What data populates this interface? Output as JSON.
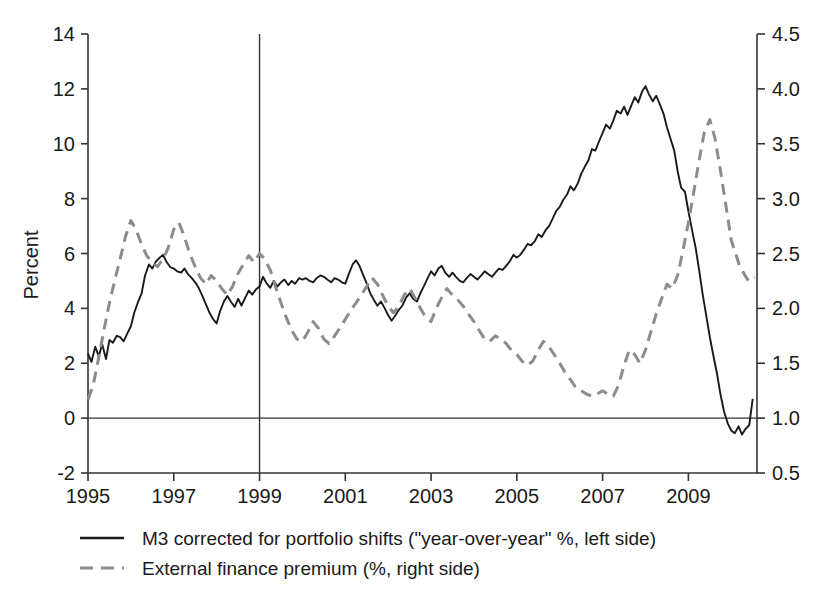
{
  "chart_data": {
    "type": "line",
    "title": "",
    "xlabel": "",
    "ylabel": "Percent",
    "y2label": "",
    "xlim": [
      1995.0,
      2010.6
    ],
    "ylim": [
      -2,
      14
    ],
    "y2lim": [
      0.5,
      4.5
    ],
    "xticks": [
      1995,
      1997,
      1999,
      2001,
      2003,
      2005,
      2007,
      2009
    ],
    "xtick_labels": [
      "1995",
      "1997",
      "1999",
      "2001",
      "2003",
      "2005",
      "2007",
      "2009"
    ],
    "yticks": [
      -2,
      0,
      2,
      4,
      6,
      8,
      10,
      12,
      14
    ],
    "ytick_labels": [
      "-2",
      "0",
      "2",
      "4",
      "6",
      "8",
      "10",
      "12",
      "14"
    ],
    "y2ticks": [
      0.5,
      1.0,
      1.5,
      2.0,
      2.5,
      3.0,
      3.5,
      4.0,
      4.5
    ],
    "y2tick_labels": [
      "0.5",
      "1.0",
      "1.5",
      "2.0",
      "2.5",
      "3.0",
      "3.5",
      "4.0",
      "4.5"
    ],
    "grid": false,
    "zero_line": 0,
    "vertical_marker": 1999,
    "legend_position": "below-left",
    "colors": {
      "m3_line": "#1a1a1a",
      "premium_line": "#8c8c8c",
      "axis": "#333333",
      "background": "#ffffff"
    },
    "series": [
      {
        "name": "M3 corrected for portfolio shifts (\"year-over-year\" %, left side)",
        "axis": "left",
        "style": "solid",
        "color": "#1a1a1a",
        "x": [
          1995.0,
          1995.08,
          1995.17,
          1995.25,
          1995.33,
          1995.42,
          1995.5,
          1995.58,
          1995.67,
          1995.75,
          1995.83,
          1995.92,
          1996.0,
          1996.08,
          1996.17,
          1996.25,
          1996.33,
          1996.42,
          1996.5,
          1996.58,
          1996.67,
          1996.75,
          1996.83,
          1996.92,
          1997.0,
          1997.08,
          1997.17,
          1997.25,
          1997.33,
          1997.42,
          1997.5,
          1997.58,
          1997.67,
          1997.75,
          1997.83,
          1997.92,
          1998.0,
          1998.08,
          1998.17,
          1998.25,
          1998.33,
          1998.42,
          1998.5,
          1998.58,
          1998.67,
          1998.75,
          1998.83,
          1998.92,
          1999.0,
          1999.08,
          1999.17,
          1999.25,
          1999.33,
          1999.42,
          1999.5,
          1999.58,
          1999.67,
          1999.75,
          1999.83,
          1999.92,
          2000.0,
          2000.08,
          2000.17,
          2000.25,
          2000.33,
          2000.42,
          2000.5,
          2000.58,
          2000.67,
          2000.75,
          2000.83,
          2000.92,
          2001.0,
          2001.08,
          2001.17,
          2001.25,
          2001.33,
          2001.42,
          2001.5,
          2001.58,
          2001.67,
          2001.75,
          2001.83,
          2001.92,
          2002.0,
          2002.08,
          2002.17,
          2002.25,
          2002.33,
          2002.42,
          2002.5,
          2002.58,
          2002.67,
          2002.75,
          2002.83,
          2002.92,
          2003.0,
          2003.08,
          2003.17,
          2003.25,
          2003.33,
          2003.42,
          2003.5,
          2003.58,
          2003.67,
          2003.75,
          2003.83,
          2003.92,
          2004.0,
          2004.08,
          2004.17,
          2004.25,
          2004.33,
          2004.42,
          2004.5,
          2004.58,
          2004.67,
          2004.75,
          2004.83,
          2004.92,
          2005.0,
          2005.08,
          2005.17,
          2005.25,
          2005.33,
          2005.42,
          2005.5,
          2005.58,
          2005.67,
          2005.75,
          2005.83,
          2005.92,
          2006.0,
          2006.08,
          2006.17,
          2006.25,
          2006.33,
          2006.42,
          2006.5,
          2006.58,
          2006.67,
          2006.75,
          2006.83,
          2006.92,
          2007.0,
          2007.08,
          2007.17,
          2007.25,
          2007.33,
          2007.42,
          2007.5,
          2007.58,
          2007.67,
          2007.75,
          2007.83,
          2007.92,
          2008.0,
          2008.08,
          2008.17,
          2008.25,
          2008.33,
          2008.42,
          2008.5,
          2008.58,
          2008.67,
          2008.75,
          2008.83,
          2008.92,
          2009.0,
          2009.08,
          2009.17,
          2009.25,
          2009.33,
          2009.42,
          2009.5,
          2009.58,
          2009.67,
          2009.75,
          2009.83,
          2009.92,
          2010.0,
          2010.08,
          2010.17,
          2010.25,
          2010.33,
          2010.42,
          2010.5
        ],
        "values": [
          2.35,
          2.05,
          2.6,
          2.25,
          2.7,
          2.15,
          2.85,
          2.75,
          3.0,
          2.95,
          2.8,
          3.1,
          3.35,
          3.85,
          4.25,
          4.55,
          5.2,
          5.6,
          5.45,
          5.7,
          5.85,
          5.95,
          5.7,
          5.5,
          5.45,
          5.35,
          5.3,
          5.45,
          5.25,
          5.1,
          4.95,
          4.75,
          4.45,
          4.15,
          3.85,
          3.6,
          3.45,
          3.9,
          4.25,
          4.45,
          4.25,
          4.05,
          4.35,
          4.1,
          4.4,
          4.65,
          4.5,
          4.7,
          4.8,
          5.15,
          4.9,
          4.75,
          5.0,
          4.8,
          4.95,
          5.05,
          4.85,
          5.0,
          4.9,
          5.1,
          5.05,
          5.1,
          5.0,
          4.95,
          5.1,
          5.2,
          5.15,
          5.05,
          4.95,
          5.1,
          5.05,
          4.95,
          4.9,
          5.25,
          5.6,
          5.75,
          5.55,
          5.2,
          4.9,
          4.55,
          4.3,
          4.1,
          4.25,
          4.0,
          3.75,
          3.55,
          3.75,
          3.95,
          4.1,
          4.4,
          4.55,
          4.35,
          4.25,
          4.55,
          4.8,
          5.1,
          5.35,
          5.2,
          5.45,
          5.55,
          5.3,
          5.15,
          5.3,
          5.15,
          5.0,
          4.95,
          5.1,
          5.25,
          5.15,
          5.05,
          5.2,
          5.35,
          5.25,
          5.15,
          5.3,
          5.45,
          5.4,
          5.55,
          5.7,
          5.95,
          5.85,
          5.95,
          6.15,
          6.35,
          6.3,
          6.45,
          6.7,
          6.6,
          6.85,
          7.0,
          7.25,
          7.55,
          7.7,
          7.95,
          8.15,
          8.45,
          8.3,
          8.55,
          8.9,
          9.15,
          9.4,
          9.8,
          9.75,
          10.1,
          10.4,
          10.7,
          10.55,
          10.85,
          11.2,
          11.1,
          11.35,
          11.05,
          11.4,
          11.7,
          11.5,
          11.9,
          12.1,
          11.8,
          11.55,
          11.75,
          11.45,
          11.1,
          10.6,
          10.2,
          9.75,
          9.0,
          8.4,
          8.25,
          7.55,
          6.9,
          6.2,
          5.4,
          4.55,
          3.7,
          2.95,
          2.3,
          1.6,
          0.85,
          0.25,
          -0.2,
          -0.45,
          -0.55,
          -0.3,
          -0.6,
          -0.4,
          -0.25,
          0.7
        ]
      },
      {
        "name": "External finance premium (%, right side)",
        "axis": "right",
        "style": "dashed",
        "color": "#8c8c8c",
        "x": [
          1995.0,
          1995.12,
          1995.25,
          1995.37,
          1995.5,
          1995.62,
          1995.75,
          1995.87,
          1996.0,
          1996.12,
          1996.25,
          1996.37,
          1996.5,
          1996.62,
          1996.75,
          1996.87,
          1997.0,
          1997.12,
          1997.25,
          1997.37,
          1997.5,
          1997.62,
          1997.75,
          1997.87,
          1998.0,
          1998.12,
          1998.25,
          1998.37,
          1998.5,
          1998.62,
          1998.75,
          1998.87,
          1999.0,
          1999.12,
          1999.25,
          1999.37,
          1999.5,
          1999.62,
          1999.75,
          1999.87,
          2000.0,
          2000.12,
          2000.25,
          2000.37,
          2000.5,
          2000.62,
          2000.75,
          2000.87,
          2001.0,
          2001.12,
          2001.25,
          2001.37,
          2001.5,
          2001.62,
          2001.75,
          2001.87,
          2002.0,
          2002.12,
          2002.25,
          2002.37,
          2002.5,
          2002.62,
          2002.75,
          2002.87,
          2003.0,
          2003.12,
          2003.25,
          2003.37,
          2003.5,
          2003.62,
          2003.75,
          2003.87,
          2004.0,
          2004.12,
          2004.25,
          2004.37,
          2004.5,
          2004.62,
          2004.75,
          2004.87,
          2005.0,
          2005.12,
          2005.25,
          2005.37,
          2005.5,
          2005.62,
          2005.75,
          2005.87,
          2006.0,
          2006.12,
          2006.25,
          2006.37,
          2006.5,
          2006.62,
          2006.75,
          2006.87,
          2007.0,
          2007.12,
          2007.25,
          2007.37,
          2007.5,
          2007.62,
          2007.75,
          2007.87,
          2008.0,
          2008.12,
          2008.25,
          2008.37,
          2008.5,
          2008.62,
          2008.75,
          2008.87,
          2009.0,
          2009.12,
          2009.25,
          2009.37,
          2009.5,
          2009.62,
          2009.75,
          2009.87,
          2010.0,
          2010.2,
          2010.4,
          2010.55
        ],
        "values": [
          1.17,
          1.3,
          1.55,
          1.8,
          2.05,
          2.25,
          2.45,
          2.65,
          2.8,
          2.72,
          2.58,
          2.48,
          2.42,
          2.38,
          2.45,
          2.55,
          2.72,
          2.78,
          2.65,
          2.5,
          2.38,
          2.28,
          2.22,
          2.3,
          2.25,
          2.18,
          2.12,
          2.2,
          2.32,
          2.4,
          2.48,
          2.42,
          2.5,
          2.45,
          2.35,
          2.2,
          2.05,
          1.92,
          1.8,
          1.72,
          1.7,
          1.78,
          1.88,
          1.82,
          1.72,
          1.68,
          1.75,
          1.82,
          1.9,
          1.98,
          2.05,
          2.12,
          2.2,
          2.28,
          2.22,
          2.12,
          2.02,
          1.96,
          2.02,
          2.12,
          2.18,
          2.1,
          2.0,
          1.92,
          1.88,
          2.0,
          2.1,
          2.18,
          2.12,
          2.08,
          2.02,
          1.95,
          1.88,
          1.8,
          1.72,
          1.7,
          1.75,
          1.72,
          1.68,
          1.62,
          1.58,
          1.52,
          1.48,
          1.52,
          1.62,
          1.7,
          1.65,
          1.58,
          1.5,
          1.42,
          1.35,
          1.28,
          1.25,
          1.22,
          1.2,
          1.22,
          1.25,
          1.22,
          1.2,
          1.3,
          1.48,
          1.62,
          1.58,
          1.5,
          1.62,
          1.78,
          1.95,
          2.08,
          2.22,
          2.18,
          2.3,
          2.52,
          2.78,
          3.05,
          3.35,
          3.6,
          3.72,
          3.55,
          3.25,
          2.95,
          2.62,
          2.38,
          2.25,
          2.28
        ]
      }
    ]
  },
  "legend": {
    "items": [
      {
        "marker": "solid-line-swatch",
        "label": "M3 corrected for portfolio shifts (\"year-over-year\" %, left side)"
      },
      {
        "marker": "dashed-line-swatch",
        "label": "External finance premium (%, right side)"
      }
    ]
  }
}
